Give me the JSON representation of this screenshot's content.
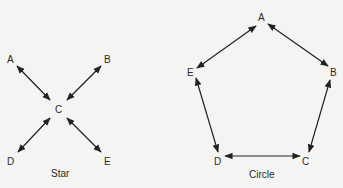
{
  "diagrams": [
    {
      "name": "star",
      "caption": "Star",
      "nodes": [
        {
          "id": "A",
          "label": "A",
          "x": 11,
          "y": 59
        },
        {
          "id": "B",
          "label": "B",
          "x": 108,
          "y": 59
        },
        {
          "id": "C",
          "label": "C",
          "x": 59,
          "y": 109
        },
        {
          "id": "D",
          "label": "D",
          "x": 11,
          "y": 160
        },
        {
          "id": "E",
          "label": "E",
          "x": 108,
          "y": 160
        }
      ],
      "edges": [
        {
          "from": "A",
          "to": "C",
          "bidirectional": true
        },
        {
          "from": "B",
          "to": "C",
          "bidirectional": true
        },
        {
          "from": "D",
          "to": "C",
          "bidirectional": true
        },
        {
          "from": "E",
          "to": "C",
          "bidirectional": true
        }
      ]
    },
    {
      "name": "circle",
      "caption": "Circle",
      "nodes": [
        {
          "id": "A",
          "label": "A",
          "x": 262,
          "y": 17
        },
        {
          "id": "B",
          "label": "B",
          "x": 331,
          "y": 72
        },
        {
          "id": "C",
          "label": "C",
          "x": 306,
          "y": 161
        },
        {
          "id": "D",
          "label": "D",
          "x": 218,
          "y": 161
        },
        {
          "id": "E",
          "label": "E",
          "x": 191,
          "y": 72
        }
      ],
      "edges": [
        {
          "from": "A",
          "to": "B",
          "bidirectional": true
        },
        {
          "from": "B",
          "to": "C",
          "bidirectional": true
        },
        {
          "from": "C",
          "to": "D",
          "bidirectional": true
        },
        {
          "from": "D",
          "to": "E",
          "bidirectional": true
        },
        {
          "from": "E",
          "to": "A",
          "bidirectional": true
        }
      ]
    }
  ],
  "colors": {
    "stroke": "#222222",
    "text": "#2a2a2a",
    "background": "#f4f4f2"
  }
}
